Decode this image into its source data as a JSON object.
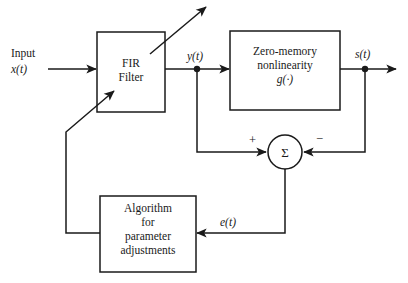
{
  "diagram": {
    "stroke_color": "#1a1a1a",
    "background_color": "#ffffff",
    "blocks": [
      {
        "id": "fir-filter",
        "lines": [
          "FIR",
          "Filter"
        ],
        "x": 97,
        "y": 32,
        "w": 68,
        "h": 80
      },
      {
        "id": "zero-memory-nonlinearity",
        "lines": [
          "Zero-memory",
          "nonlinearity",
          "g(·)"
        ],
        "x": 230,
        "y": 31,
        "w": 110,
        "h": 79
      },
      {
        "id": "algorithm-for-parameter-adjustments",
        "lines": [
          "Algorithm",
          "for",
          "parameter",
          "adjustments"
        ],
        "x": 100,
        "y": 196,
        "w": 96,
        "h": 76
      }
    ],
    "summing_junction": {
      "id": "summing-junction",
      "glyph": "Σ",
      "cx": 285,
      "cy": 152,
      "r": 17,
      "plus_sign": "+",
      "minus_sign": "−"
    },
    "labels": {
      "input_word": "Input",
      "input_signal": "x(t)",
      "filter_output": "y(t)",
      "system_output": "s(t)",
      "error_signal": "e(t)"
    },
    "nodes": [
      {
        "id": "y-node",
        "cx": 197,
        "cy": 69
      },
      {
        "id": "s-node",
        "cx": 365,
        "cy": 69
      }
    ]
  }
}
